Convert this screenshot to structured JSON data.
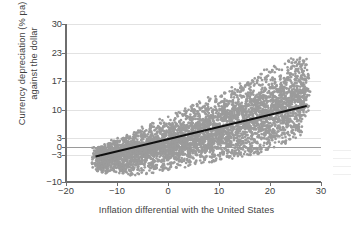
{
  "chart_data": {
    "type": "scatter",
    "title": "",
    "xlabel": "Inflation differential with the United States",
    "ylabel_line1": "Currency depreciation (% pa)",
    "ylabel_line2": "against the dollar",
    "xticks": [
      -20,
      -10,
      0,
      10,
      20,
      30
    ],
    "xtick_labels": [
      "-20",
      "-10",
      "0",
      "10",
      "20",
      "30"
    ],
    "yticks": [
      30,
      23,
      17,
      10,
      3,
      0,
      -3,
      -10
    ],
    "ytick_labels": [
      "30",
      "23",
      "17",
      "10",
      "3",
      "0",
      "-3",
      "-10"
    ],
    "xlim": [
      -20,
      30
    ],
    "ylim": [
      -10,
      30
    ],
    "grid": true,
    "legend": null,
    "zero_line": {
      "y": 0,
      "color": "#9a9a9a",
      "label": "zero reference line"
    },
    "series": [
      {
        "name": "Country-year observations",
        "type": "scatter",
        "marker_color": "#9b9b9b",
        "description": "Dense elongated cloud of points trending upward from lower-left to upper-right",
        "x_range": [
          -14,
          27
        ],
        "y_range": [
          -5.5,
          16.5
        ],
        "points": [
          [
            -14.0,
            -3.2
          ],
          [
            -13.4,
            -4.1
          ],
          [
            -13.0,
            -2.6
          ],
          [
            -12.6,
            -4.6
          ],
          [
            -12.2,
            -3.0
          ],
          [
            -11.8,
            -1.9
          ],
          [
            -11.4,
            -4.9
          ],
          [
            -11.0,
            -2.2
          ],
          [
            -10.6,
            -3.8
          ],
          [
            -10.2,
            -1.1
          ],
          [
            -9.8,
            -4.4
          ],
          [
            -9.4,
            -2.7
          ],
          [
            -9.0,
            -0.4
          ],
          [
            -8.6,
            -3.5
          ],
          [
            -8.2,
            -5.0
          ],
          [
            -7.8,
            -1.6
          ],
          [
            -7.4,
            0.4
          ],
          [
            -7.0,
            -3.1
          ],
          [
            -6.6,
            -4.7
          ],
          [
            -6.2,
            -1.0
          ],
          [
            -5.8,
            1.2
          ],
          [
            -5.4,
            -2.4
          ],
          [
            -5.0,
            -4.2
          ],
          [
            -4.6,
            0.1
          ],
          [
            -4.2,
            2.0
          ],
          [
            -3.8,
            -1.8
          ],
          [
            -3.4,
            -3.9
          ],
          [
            -3.0,
            0.9
          ],
          [
            -2.6,
            2.8
          ],
          [
            -2.2,
            -1.2
          ],
          [
            -1.8,
            -3.4
          ],
          [
            -1.4,
            1.6
          ],
          [
            -1.0,
            3.6
          ],
          [
            -0.6,
            -0.6
          ],
          [
            -0.2,
            -2.9
          ],
          [
            0.2,
            2.2
          ],
          [
            0.6,
            4.4
          ],
          [
            1.0,
            0.2
          ],
          [
            1.4,
            -2.4
          ],
          [
            1.8,
            2.9
          ],
          [
            2.2,
            5.2
          ],
          [
            2.6,
            0.9
          ],
          [
            3.0,
            -1.9
          ],
          [
            3.4,
            3.6
          ],
          [
            3.8,
            6.0
          ],
          [
            4.2,
            1.6
          ],
          [
            4.6,
            -1.4
          ],
          [
            5.0,
            4.3
          ],
          [
            5.4,
            6.8
          ],
          [
            5.8,
            2.3
          ],
          [
            6.2,
            -0.9
          ],
          [
            6.6,
            5.0
          ],
          [
            7.0,
            7.6
          ],
          [
            7.4,
            3.0
          ],
          [
            7.8,
            -0.4
          ],
          [
            8.2,
            5.8
          ],
          [
            8.6,
            8.4
          ],
          [
            9.0,
            3.7
          ],
          [
            9.4,
            0.1
          ],
          [
            9.8,
            6.5
          ],
          [
            10.2,
            9.2
          ],
          [
            10.6,
            4.4
          ],
          [
            11.0,
            0.6
          ],
          [
            11.4,
            7.2
          ],
          [
            11.8,
            10.0
          ],
          [
            12.2,
            5.1
          ],
          [
            12.6,
            1.1
          ],
          [
            13.0,
            8.0
          ],
          [
            13.4,
            10.8
          ],
          [
            13.8,
            5.8
          ],
          [
            14.2,
            1.6
          ],
          [
            14.6,
            8.7
          ],
          [
            15.0,
            11.6
          ],
          [
            15.4,
            6.5
          ],
          [
            15.8,
            2.1
          ],
          [
            16.2,
            9.4
          ],
          [
            16.6,
            12.4
          ],
          [
            17.0,
            7.2
          ],
          [
            17.4,
            2.6
          ],
          [
            17.8,
            10.1
          ],
          [
            18.2,
            13.2
          ],
          [
            18.6,
            7.9
          ],
          [
            19.0,
            4.2
          ],
          [
            19.4,
            10.8
          ],
          [
            19.8,
            14.0
          ],
          [
            20.2,
            8.6
          ],
          [
            20.6,
            5.4
          ],
          [
            21.0,
            11.5
          ],
          [
            21.4,
            14.8
          ],
          [
            21.8,
            9.3
          ],
          [
            22.2,
            6.6
          ],
          [
            22.6,
            12.2
          ],
          [
            23.0,
            15.4
          ],
          [
            23.4,
            10.0
          ],
          [
            23.8,
            7.8
          ],
          [
            24.2,
            12.9
          ],
          [
            24.6,
            15.8
          ],
          [
            25.0,
            10.7
          ],
          [
            25.4,
            9.0
          ],
          [
            25.8,
            13.6
          ],
          [
            26.2,
            16.1
          ],
          [
            26.6,
            14.2
          ],
          [
            27.0,
            15.6
          ]
        ]
      },
      {
        "name": "Fitted regression line",
        "type": "line",
        "color": "#111111",
        "x_start": -14,
        "y_start": -3.3,
        "x_end": 27,
        "y_end": 10.8,
        "slope": 0.344,
        "intercept": 1.52
      }
    ]
  },
  "figure": {
    "xlabel": "Inflation differential with the United States",
    "ylabel_line1": "Currency depreciation (% pa)",
    "ylabel_line2": "against the dollar"
  },
  "page_bleed": {
    "description": "faint text fragments bleeding from adjacent page at right edge",
    "visible": true
  }
}
